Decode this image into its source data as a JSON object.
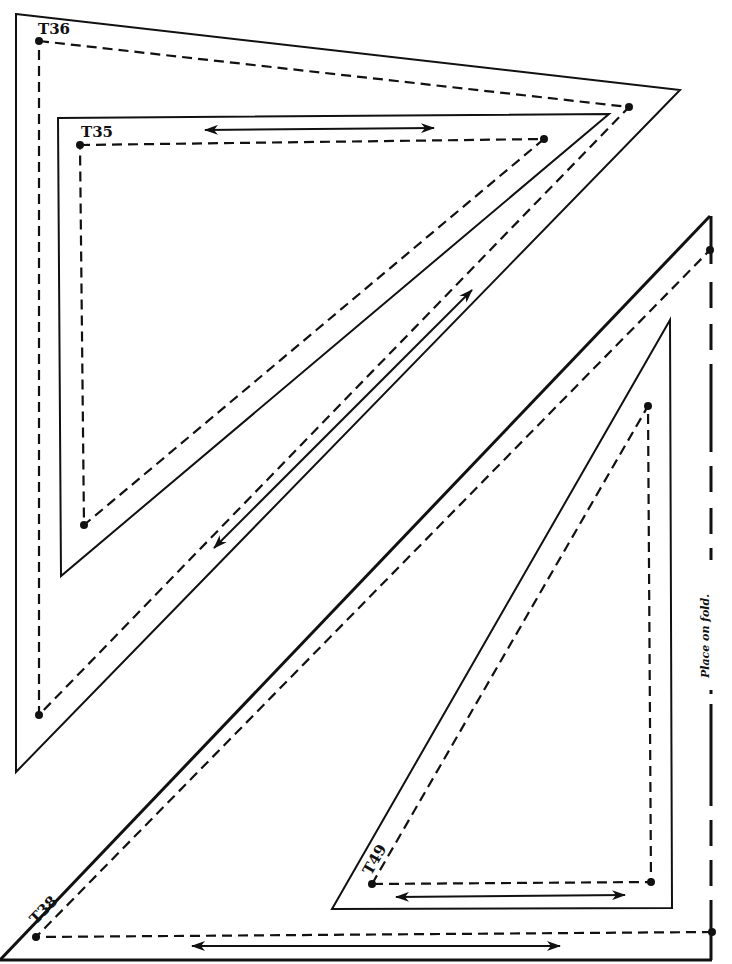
{
  "pieces": [
    {
      "id": "T36",
      "label": "T36",
      "cut_outline": [
        [
          16,
          14
        ],
        [
          680,
          90
        ],
        [
          16,
          772
        ]
      ],
      "seam_outline": [
        [
          39,
          41
        ],
        [
          629,
          107
        ],
        [
          39,
          715
        ]
      ],
      "grainline": {
        "from": [
          214,
          548
        ],
        "to": [
          472,
          290
        ],
        "arrows": "both"
      }
    },
    {
      "id": "T35",
      "label": "T35",
      "cut_outline": [
        [
          58,
          118
        ],
        [
          609,
          114
        ],
        [
          61,
          576
        ]
      ],
      "seam_outline": [
        [
          80,
          145
        ],
        [
          544,
          139
        ],
        [
          84,
          525
        ]
      ],
      "grainline": {
        "from": [
          205,
          130
        ],
        "to": [
          434,
          128
        ],
        "arrows": "both"
      }
    },
    {
      "id": "T38",
      "label": "T38",
      "cut_outline": [
        [
          2,
          958
        ],
        [
          710,
          216
        ],
        [
          710,
          958
        ]
      ],
      "seam_outline": [
        [
          36,
          937
        ],
        [
          710,
          250
        ],
        [
          712,
          932
        ]
      ],
      "grainline": {
        "from": [
          192,
          946
        ],
        "to": [
          560,
          946
        ],
        "arrows": "both"
      }
    },
    {
      "id": "T49",
      "label": "T49",
      "cut_outline": [
        [
          332,
          909
        ],
        [
          670,
          320
        ],
        [
          672,
          908
        ]
      ],
      "seam_outline": [
        [
          372,
          884
        ],
        [
          648,
          406
        ],
        [
          651,
          882
        ]
      ],
      "grainline": {
        "from": [
          396,
          897
        ],
        "to": [
          625,
          895
        ],
        "arrows": "both"
      }
    }
  ],
  "fold": {
    "label": "Place on fold.",
    "x": 711,
    "y_start": 216,
    "y_end": 958
  },
  "colors": {
    "ink": "#111111",
    "paper": "#ffffff"
  }
}
